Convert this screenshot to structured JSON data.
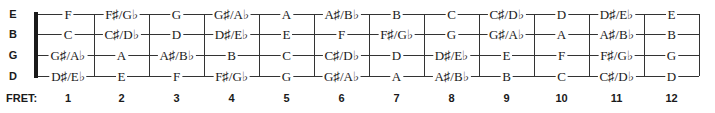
{
  "diagram": {
    "strings": [
      {
        "name": "E",
        "notes": [
          "F",
          "F♯/G♭",
          "G",
          "G♯/A♭",
          "A",
          "A♯/B♭",
          "B",
          "C",
          "C♯/D♭",
          "D",
          "D♯/E♭",
          "E"
        ]
      },
      {
        "name": "B",
        "notes": [
          "C",
          "C♯/D♭",
          "D",
          "D♯/E♭",
          "E",
          "F",
          "F♯/G♭",
          "G",
          "G♯/A♭",
          "A",
          "A♯/B♭",
          "B"
        ]
      },
      {
        "name": "G",
        "notes": [
          "G♯/A♭",
          "A",
          "A♯/B♭",
          "B",
          "C",
          "C♯/D♭",
          "D",
          "D♯/E♭",
          "E",
          "F",
          "F♯/G♭",
          "G"
        ]
      },
      {
        "name": "D",
        "notes": [
          "D♯/E♭",
          "E",
          "F",
          "F♯/G♭",
          "G",
          "G♯/A♭",
          "A",
          "A♯/B♭",
          "B",
          "C",
          "C♯/D♭",
          "D"
        ]
      }
    ],
    "fret_label": "FRET:",
    "frets": [
      "1",
      "2",
      "3",
      "4",
      "5",
      "6",
      "7",
      "8",
      "9",
      "10",
      "11",
      "12"
    ]
  }
}
